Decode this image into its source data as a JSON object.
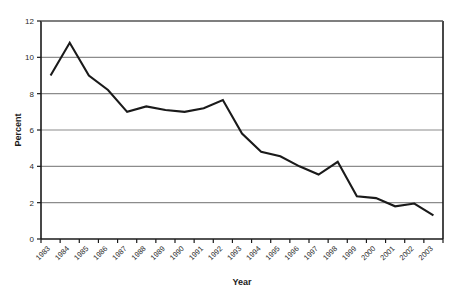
{
  "chart_data": {
    "type": "line",
    "title": "",
    "xlabel": "Year",
    "ylabel": "Percent",
    "ylim": [
      0,
      12
    ],
    "y_ticks": [
      "0",
      "2",
      "4",
      "6",
      "8",
      "10",
      "12"
    ],
    "grid": true,
    "legend": "none",
    "categories": [
      "1983",
      "1984",
      "1985",
      "1986",
      "1987",
      "1988",
      "1989",
      "1990",
      "1991",
      "1992",
      "1993",
      "1994",
      "1995",
      "1996",
      "1997",
      "1998",
      "1999",
      "2000",
      "2001",
      "2002",
      "2003"
    ],
    "values": [
      9.0,
      10.8,
      9.0,
      8.2,
      7.0,
      7.3,
      7.1,
      7.0,
      7.2,
      7.65,
      5.8,
      4.8,
      4.55,
      4.0,
      3.55,
      4.25,
      2.35,
      2.25,
      1.8,
      1.95,
      1.3
    ],
    "series": [
      {
        "name": "Percent",
        "color": "#1a1a1a",
        "values": [
          9.0,
          10.8,
          9.0,
          8.2,
          7.0,
          7.3,
          7.1,
          7.0,
          7.2,
          7.65,
          5.8,
          4.8,
          4.55,
          4.0,
          3.55,
          4.25,
          2.35,
          2.25,
          1.8,
          1.95,
          1.3
        ]
      }
    ]
  },
  "style": {
    "line_color": "#1a1a1a",
    "grid_color": "#8c8c8c",
    "axis_color": "#1a1a1a",
    "background": "#ffffff"
  }
}
